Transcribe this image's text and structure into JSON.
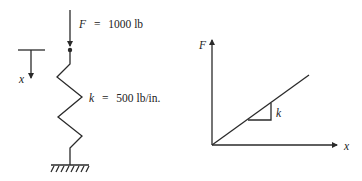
{
  "spring_diagram": {
    "force_label": {
      "symbol": "F",
      "equals": "=",
      "value": "1000 lb"
    },
    "stiffness_label": {
      "symbol": "k",
      "equals": "=",
      "value": "500 lb/in."
    },
    "displacement_label": "x"
  },
  "force_displacement_plot": {
    "y_axis_label": "F",
    "x_axis_label": "x",
    "slope_label": "k"
  },
  "colors": {
    "ink": "#2a2a2a",
    "background": "#ffffff"
  }
}
